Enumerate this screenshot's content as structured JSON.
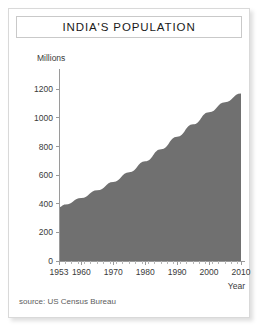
{
  "figure": {
    "title": "INDIA'S POPULATION",
    "source_note": "source: US Census Bureau",
    "area_color": "#707070",
    "frame_color": "#d9d9d9",
    "axis_color": "#9a9a9a"
  },
  "chart_data": {
    "type": "area",
    "title": "INDIA'S POPULATION",
    "subtitle": "",
    "xlabel": "Year",
    "ylabel": "Millions",
    "xlim": [
      1953,
      2010
    ],
    "ylim": [
      0,
      1300
    ],
    "grid": false,
    "legend": null,
    "annotations": [
      "source: US Census Bureau"
    ],
    "x_ticks": [
      1953,
      1960,
      1970,
      1980,
      1990,
      2000,
      2010
    ],
    "x_tick_labels": [
      "1953",
      "1960",
      "1970",
      "1980",
      "1990",
      "2000",
      "2010"
    ],
    "x_minor_tick_step": 2,
    "y_ticks": [
      0,
      200,
      400,
      600,
      800,
      1000,
      1200
    ],
    "y_tick_labels": [
      "0",
      "200",
      "400",
      "600",
      "800",
      "1000",
      "1200"
    ],
    "series": [
      {
        "name": "Population (millions)",
        "color": "#707070",
        "x": [
          1953,
          1955,
          1960,
          1965,
          1970,
          1975,
          1980,
          1985,
          1990,
          1995,
          2000,
          2005,
          2010
        ],
        "values": [
          376,
          395,
          441,
          495,
          553,
          620,
          697,
          781,
          868,
          955,
          1040,
          1110,
          1170
        ]
      }
    ]
  }
}
